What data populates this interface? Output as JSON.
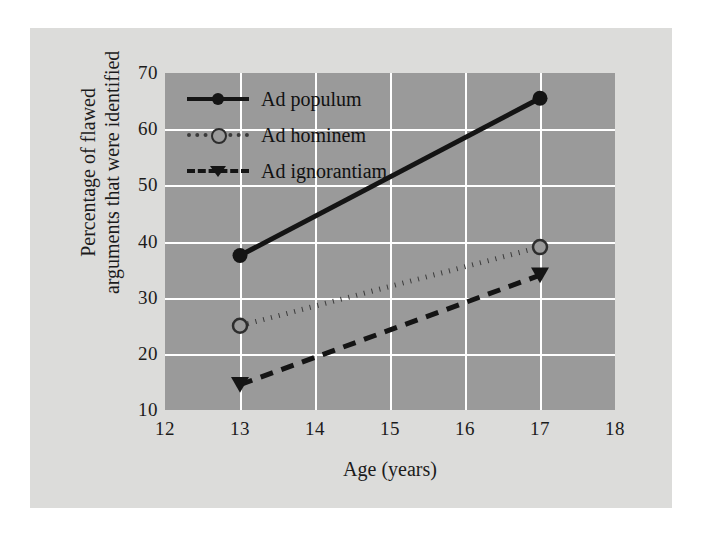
{
  "chart_data": {
    "type": "line",
    "title": "",
    "xlabel": "Age (years)",
    "ylabel": "Percentage of flawed arguments that were identified",
    "ylabel_line1": "Percentage of flawed",
    "ylabel_line2": "arguments that were identified",
    "x": [
      13,
      17
    ],
    "xlim": [
      12,
      18
    ],
    "ylim": [
      10,
      70
    ],
    "xticks": [
      "12",
      "13",
      "14",
      "15",
      "16",
      "17",
      "18"
    ],
    "yticks": [
      "10",
      "20",
      "30",
      "40",
      "50",
      "60",
      "70"
    ],
    "grid": true,
    "legend_position": "top-left-inside",
    "series": [
      {
        "name": "Ad populum",
        "values": [
          37.5,
          65.5
        ],
        "line_style": "solid",
        "marker": "circle-filled",
        "color": "#141414"
      },
      {
        "name": "Ad hominem",
        "values": [
          25.0,
          39.0
        ],
        "line_style": "dotted",
        "marker": "circle-open",
        "color": "#3a3a3a"
      },
      {
        "name": "Ad ignorantiam",
        "values": [
          14.5,
          34.0
        ],
        "line_style": "dashed",
        "marker": "triangle-down",
        "color": "#141414"
      }
    ],
    "colors": {
      "plot_background": "#9a9a9a",
      "figure_background": "#dcdcda",
      "page_background": "#ffffff",
      "gridline": "#ffffff",
      "text": "#1b1b1b"
    }
  }
}
